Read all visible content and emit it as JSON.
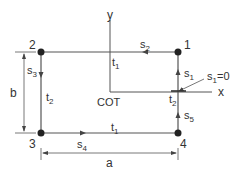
{
  "diagram": {
    "title": "",
    "colors": {
      "line": "#555555",
      "node": "#222222",
      "text": "#333333"
    },
    "nodes": [
      {
        "id": "1",
        "label": "1"
      },
      {
        "id": "2",
        "label": "2"
      },
      {
        "id": "3",
        "label": "3"
      },
      {
        "id": "4",
        "label": "4"
      }
    ],
    "axes": {
      "y": "y",
      "x": "x",
      "origin": "COT"
    },
    "segments": {
      "s1": "s",
      "s1_sub": "1",
      "s2": "s",
      "s2_sub": "2",
      "s3": "s",
      "s3_sub": "3",
      "s4": "s",
      "s4_sub": "4",
      "s5": "s",
      "s5_sub": "5"
    },
    "thickness": {
      "top": "t",
      "top_sub": "1",
      "bottom": "t",
      "bottom_sub": "1",
      "left": "t",
      "left_sub": "2",
      "right": "t",
      "right_sub": "2"
    },
    "annotation": {
      "text_main": "s",
      "text_sub": "1",
      "text_rest": "=0"
    },
    "dimensions": {
      "width": "a",
      "height": "b"
    }
  }
}
